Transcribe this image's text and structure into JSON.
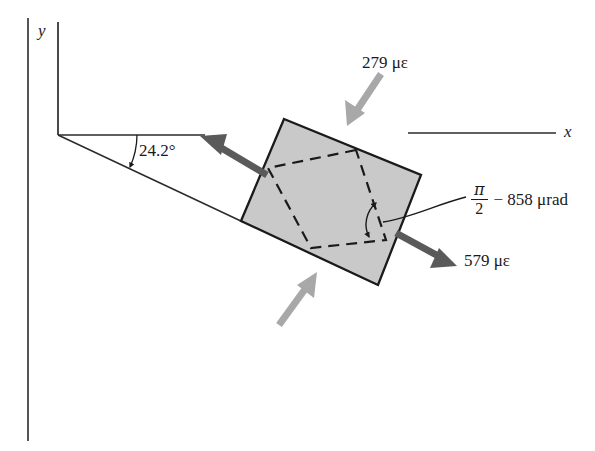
{
  "figure": {
    "background_color": "#ffffff",
    "square_fill_color": "#c9c9c9",
    "square_stroke_color": "#1a1a1a",
    "dark_arrow_color": "#5a5a5a",
    "light_arrow_color": "#a8a8a8",
    "axis_color": "#2b2b2b",
    "margin_rule_color": "#555555"
  },
  "axes": {
    "x_label": "x",
    "y_label": "y",
    "origin": {
      "x": 58,
      "y": 135
    }
  },
  "angles": {
    "inclination": {
      "label": "24.2°",
      "value": 24.2,
      "unit": "degree"
    },
    "shear": {
      "numerator": "π",
      "denominator": "2",
      "rest": "− 858 μrad",
      "value": -858,
      "unit": "μrad",
      "full_text": "π/2 − 858 μrad"
    }
  },
  "strains": {
    "normal_top": {
      "label": "279 με",
      "value": 279,
      "unit": "με"
    },
    "normal_right": {
      "label": "579 με",
      "value": 579,
      "unit": "με"
    }
  },
  "arrows": [
    {
      "name": "left-dark-arrow",
      "color": "#5a5a5a",
      "direction": "up-left"
    },
    {
      "name": "top-light-arrow",
      "color": "#a8a8a8",
      "direction": "down-left"
    },
    {
      "name": "bottom-light-arrow",
      "color": "#a8a8a8",
      "direction": "up-right"
    },
    {
      "name": "right-dark-arrow",
      "color": "#5a5a5a",
      "direction": "down-right"
    }
  ]
}
